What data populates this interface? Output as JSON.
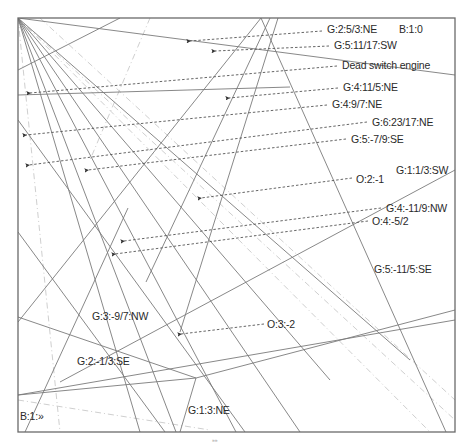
{
  "diagram": {
    "frame": {
      "x1": 18,
      "y1": 18,
      "x2": 455,
      "y2": 432,
      "color": "#6a6a6a"
    },
    "colors": {
      "solid_line": "#7a7a7a",
      "dashed_arrow": "#555555",
      "faint_line": "#cfcfcf",
      "text": "#2a2a2a"
    },
    "top_mark": "",
    "bottom_mark": "»»",
    "solid_lines": [
      {
        "x1": 18,
        "y1": 18,
        "x2": 455,
        "y2": 75
      },
      {
        "x1": 18,
        "y1": 18,
        "x2": 140,
        "y2": 432
      },
      {
        "x1": 18,
        "y1": 18,
        "x2": 176,
        "y2": 432
      },
      {
        "x1": 18,
        "y1": 18,
        "x2": 236,
        "y2": 432
      },
      {
        "x1": 18,
        "y1": 18,
        "x2": 300,
        "y2": 432
      },
      {
        "x1": 18,
        "y1": 18,
        "x2": 330,
        "y2": 380
      },
      {
        "x1": 18,
        "y1": 18,
        "x2": 410,
        "y2": 360
      },
      {
        "x1": 261,
        "y1": 18,
        "x2": 18,
        "y2": 322
      },
      {
        "x1": 261,
        "y1": 18,
        "x2": 446,
        "y2": 432
      },
      {
        "x1": 180,
        "y1": 332,
        "x2": 278,
        "y2": 18
      },
      {
        "x1": 18,
        "y1": 120,
        "x2": 245,
        "y2": 432
      },
      {
        "x1": 18,
        "y1": 70,
        "x2": 120,
        "y2": 18
      },
      {
        "x1": 18,
        "y1": 395,
        "x2": 196,
        "y2": 378
      },
      {
        "x1": 196,
        "y1": 378,
        "x2": 180,
        "y2": 432
      },
      {
        "x1": 18,
        "y1": 317,
        "x2": 196,
        "y2": 378
      },
      {
        "x1": 196,
        "y1": 378,
        "x2": 455,
        "y2": 310
      },
      {
        "x1": 60,
        "y1": 382,
        "x2": 455,
        "y2": 170
      },
      {
        "x1": 146,
        "y1": 282,
        "x2": 270,
        "y2": 18
      },
      {
        "x1": 18,
        "y1": 232,
        "x2": 165,
        "y2": 432
      },
      {
        "x1": 25,
        "y1": 432,
        "x2": 128,
        "y2": 208
      },
      {
        "x1": 18,
        "y1": 95,
        "x2": 290,
        "y2": 87
      },
      {
        "x1": 18,
        "y1": 395,
        "x2": 455,
        "y2": 320
      }
    ],
    "faint_lines": [
      {
        "x1": 18,
        "y1": 18,
        "x2": 455,
        "y2": 420
      },
      {
        "x1": 18,
        "y1": 18,
        "x2": 430,
        "y2": 432
      },
      {
        "x1": 40,
        "y1": 18,
        "x2": 455,
        "y2": 400
      },
      {
        "x1": 18,
        "y1": 18,
        "x2": 60,
        "y2": 432
      },
      {
        "x1": 150,
        "y1": 18,
        "x2": 90,
        "y2": 160
      },
      {
        "x1": 18,
        "y1": 400,
        "x2": 210,
        "y2": 430
      }
    ],
    "labels": [
      {
        "id": "g-2-5-3-ne",
        "text": "G:2:5/3:NE",
        "x": 327,
        "y": 24,
        "arrow": {
          "x1": 322,
          "y1": 31,
          "x2": 190,
          "y2": 41
        }
      },
      {
        "id": "b-1-0",
        "text": "B:1:0",
        "x": 399,
        "y": 24,
        "arrow": null
      },
      {
        "id": "g-5-11-17-sw",
        "text": "G:5:11/17:SW",
        "x": 334,
        "y": 40,
        "arrow": {
          "x1": 329,
          "y1": 46,
          "x2": 215,
          "y2": 51
        }
      },
      {
        "id": "dead-switch-engine",
        "text": "Dead switch engine",
        "x": 342,
        "y": 60,
        "arrow": {
          "x1": 337,
          "y1": 66,
          "x2": 30,
          "y2": 93
        }
      },
      {
        "id": "g-4-11-5-ne",
        "text": "G:4:11/5:NE",
        "x": 343,
        "y": 82,
        "arrow": {
          "x1": 338,
          "y1": 88,
          "x2": 229,
          "y2": 98
        }
      },
      {
        "id": "g-4-9-7-ne",
        "text": "G:4:9/7:NE",
        "x": 332,
        "y": 99,
        "arrow": {
          "x1": 327,
          "y1": 105,
          "x2": 26,
          "y2": 135
        }
      },
      {
        "id": "g-6-23-17-ne",
        "text": "G:6:23/17:NE",
        "x": 372,
        "y": 117,
        "arrow": {
          "x1": 367,
          "y1": 122,
          "x2": 29,
          "y2": 165
        }
      },
      {
        "id": "g-5-7-9-se",
        "text": "G:5:-7/9:SE",
        "x": 351,
        "y": 134,
        "arrow": {
          "x1": 346,
          "y1": 139,
          "x2": 88,
          "y2": 170
        }
      },
      {
        "id": "g-1-1-3-sw",
        "text": "G:1:1/3:SW",
        "x": 396,
        "y": 165,
        "arrow": null
      },
      {
        "id": "o-2-1",
        "text": "O:2:-1",
        "x": 356,
        "y": 174,
        "arrow": {
          "x1": 352,
          "y1": 178,
          "x2": 201,
          "y2": 198
        }
      },
      {
        "id": "g-4-11-9-nw",
        "text": "G:4:-11/9:NW",
        "x": 386,
        "y": 203,
        "arrow": {
          "x1": 381,
          "y1": 208,
          "x2": 124,
          "y2": 241
        }
      },
      {
        "id": "o-4-5-2",
        "text": "O:4:-5/2",
        "x": 372,
        "y": 216,
        "arrow": {
          "x1": 368,
          "y1": 221,
          "x2": 115,
          "y2": 254
        }
      },
      {
        "id": "g-5-11-5-se",
        "text": "G:5:-11/5:SE",
        "x": 374,
        "y": 264,
        "arrow": null
      },
      {
        "id": "g-3-9-7-nw",
        "text": "G:3:-9/7:NW",
        "x": 92,
        "y": 311,
        "arrow": null
      },
      {
        "id": "o-3-2",
        "text": "O:3:-2",
        "x": 267,
        "y": 319,
        "arrow": {
          "x1": 264,
          "y1": 324,
          "x2": 181,
          "y2": 334
        }
      },
      {
        "id": "g-2-1-3-se",
        "text": "G:2:-1/3:SE",
        "x": 77,
        "y": 356,
        "arrow": null
      },
      {
        "id": "g-1-3-ne",
        "text": "G:1:3:NE",
        "x": 188,
        "y": 405,
        "arrow": null
      },
      {
        "id": "b-1-raquo",
        "text": "B:1:»",
        "x": 20,
        "y": 411,
        "arrow": null
      }
    ]
  }
}
